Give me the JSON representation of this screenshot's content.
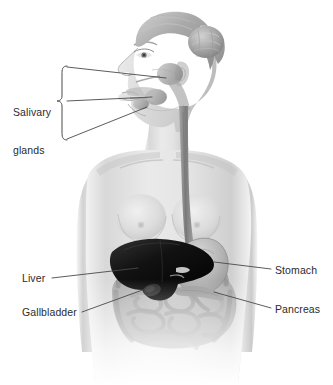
{
  "illustration": {
    "title": "Human digestive system anatomy",
    "subject": "female figure, lateral head profile facing left, anterior torso",
    "style": "grayscale medical illustration",
    "background_color": "#ffffff",
    "line_color": "#4a4a4a",
    "text_color": "#2b2b2b"
  },
  "labels": {
    "salivary_glands": "Salivary\nglands",
    "salivary_glands_line1": "Salivary",
    "salivary_glands_line2": "glands",
    "liver": "Liver",
    "gallbladder": "Gallbladder",
    "stomach": "Stomach",
    "pancreas": "Pancreas"
  },
  "organs": [
    {
      "name": "salivary-glands",
      "side": "left",
      "shade": "#9a9a9a"
    },
    {
      "name": "esophagus",
      "side": "center",
      "shade": "#8e8e8e"
    },
    {
      "name": "liver",
      "side": "left",
      "shade": "#141414"
    },
    {
      "name": "gallbladder",
      "side": "left",
      "shade": "#2a2a2a"
    },
    {
      "name": "stomach",
      "side": "right",
      "shade": "#b0b0b0"
    },
    {
      "name": "pancreas",
      "side": "right",
      "shade": "#9c9c9c"
    },
    {
      "name": "intestines",
      "side": "center",
      "shade": "#a8a8a8"
    }
  ],
  "leader_lines": {
    "brace_label": "salivary-glands-brace",
    "count": 7
  }
}
